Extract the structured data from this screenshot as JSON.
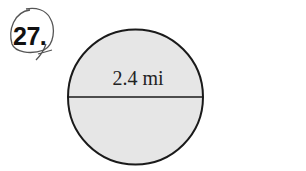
{
  "problem": {
    "number": "27."
  },
  "figure": {
    "shape": "circle",
    "diameter_label": "2.4 mi",
    "fill_color": "#e6e6e6",
    "stroke_color": "#1a1a1a"
  }
}
